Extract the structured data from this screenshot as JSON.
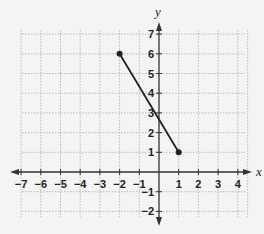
{
  "chart_data": {
    "type": "line",
    "title": "",
    "xlabel": "x",
    "ylabel": "y",
    "xlim": [
      -7,
      4
    ],
    "ylim": [
      -2,
      7
    ],
    "grid": true,
    "x_ticks": [
      -7,
      -6,
      -5,
      -4,
      -3,
      -2,
      -1,
      1,
      2,
      3,
      4
    ],
    "y_ticks": [
      -2,
      -1,
      1,
      2,
      3,
      4,
      5,
      6,
      7
    ],
    "series": [
      {
        "name": "segment",
        "points": [
          [
            -2,
            6
          ],
          [
            1,
            1
          ]
        ],
        "endpoints_marked": true,
        "color": "#222222"
      }
    ]
  }
}
